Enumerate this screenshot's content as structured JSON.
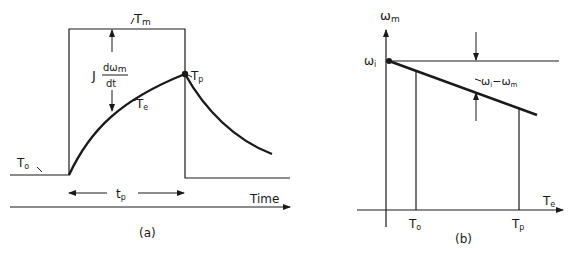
{
  "panel_a": {
    "caption": "(a)",
    "labels": {
      "Tm": "T",
      "Tm_sub": "m",
      "J": "J",
      "num": "dω",
      "num_sub": "m",
      "den": "dt",
      "Te": "T",
      "Te_sub": "e",
      "Tp": "T",
      "Tp_sub": "p",
      "To": "T",
      "To_sub": "o",
      "tp": "t",
      "tp_sub": "p",
      "time_axis": "Time"
    }
  },
  "panel_b": {
    "caption": "(b)",
    "labels": {
      "y_axis": "ω",
      "y_axis_sub": "m",
      "omega_i": "ω",
      "omega_i_sub": "i",
      "x_axis": "T",
      "x_axis_sub": "e",
      "To": "T",
      "To_sub": "o",
      "Tp": "T",
      "Tp_sub": "p",
      "slip": "ω",
      "slip_sub1": "i",
      "slip_mid": "−ω",
      "slip_sub2": "m"
    }
  },
  "colors": {
    "ink": "#1a1a1a",
    "background": "#ffffff"
  }
}
